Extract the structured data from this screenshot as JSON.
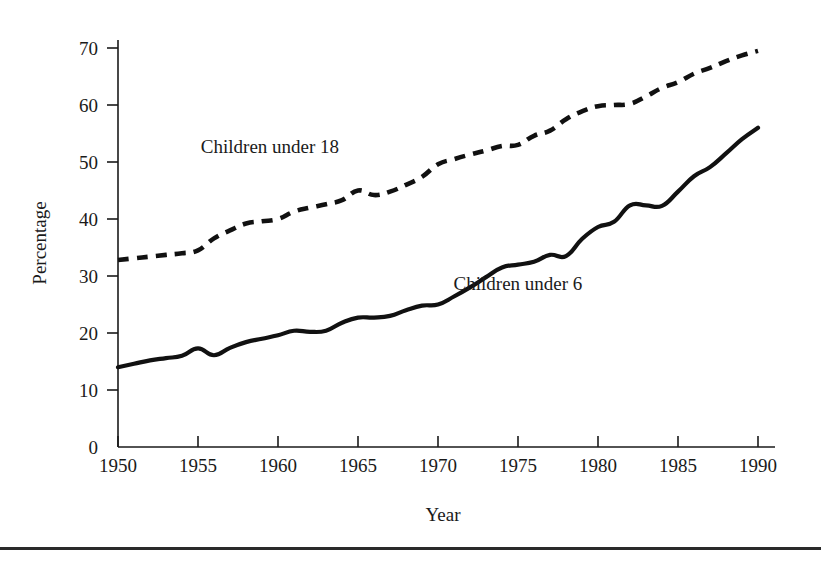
{
  "chart_data": {
    "type": "line",
    "title": "",
    "xlabel": "Year",
    "ylabel": "Percentage",
    "xlim": [
      1950,
      1990
    ],
    "ylim": [
      0,
      73
    ],
    "xticks": [
      1950,
      1955,
      1960,
      1965,
      1970,
      1975,
      1980,
      1985,
      1990
    ],
    "yticks": [
      0,
      10,
      20,
      30,
      40,
      50,
      60,
      70
    ],
    "grid": false,
    "legend_position": "inline-annotation",
    "x": [
      1950,
      1951,
      1952,
      1953,
      1954,
      1955,
      1956,
      1957,
      1958,
      1959,
      1960,
      1961,
      1962,
      1963,
      1964,
      1965,
      1966,
      1967,
      1968,
      1969,
      1970,
      1971,
      1972,
      1973,
      1974,
      1975,
      1976,
      1977,
      1978,
      1979,
      1980,
      1981,
      1982,
      1983,
      1984,
      1985,
      1986,
      1987,
      1988,
      1989,
      1990
    ],
    "series": [
      {
        "name": "Children under 18",
        "style": "dashed",
        "color": "#111111",
        "values": [
          32.8,
          33.1,
          33.4,
          33.7,
          34.0,
          34.5,
          36.6,
          38.0,
          39.2,
          39.6,
          40.0,
          41.3,
          42.0,
          42.6,
          43.3,
          45.0,
          44.2,
          44.8,
          46.0,
          47.4,
          49.6,
          50.5,
          51.3,
          52.0,
          52.8,
          53.0,
          54.6,
          55.5,
          57.5,
          58.9,
          59.8,
          60.0,
          60.2,
          61.5,
          63.0,
          64.0,
          65.5,
          66.5,
          67.7,
          68.7,
          69.5
        ]
      },
      {
        "name": "Children under 6",
        "style": "solid",
        "color": "#111111",
        "values": [
          14.0,
          14.6,
          15.2,
          15.6,
          16.0,
          17.3,
          16.1,
          17.4,
          18.4,
          19.0,
          19.6,
          20.4,
          20.2,
          20.4,
          21.8,
          22.7,
          22.7,
          23.0,
          24.0,
          24.8,
          25.0,
          26.4,
          28.0,
          29.8,
          31.5,
          32.0,
          32.5,
          33.7,
          33.5,
          36.5,
          38.6,
          39.5,
          42.4,
          42.4,
          42.3,
          44.8,
          47.5,
          49.1,
          51.5,
          54.0,
          56.0
        ]
      }
    ],
    "annotations": [
      {
        "text": "Children under 18",
        "x": 1959.5,
        "y": 51.5
      },
      {
        "text": "Children under 6",
        "x": 1975.0,
        "y": 27.5
      }
    ]
  },
  "axis": {
    "y_title": "Percentage",
    "x_title": "Year",
    "y_tick_labels": [
      "70",
      "60",
      "50",
      "40",
      "30",
      "20",
      "10",
      "0"
    ],
    "x_tick_labels": [
      "1950",
      "1955",
      "1960",
      "1965",
      "1970",
      "1975",
      "1980",
      "1985",
      "1990"
    ]
  }
}
